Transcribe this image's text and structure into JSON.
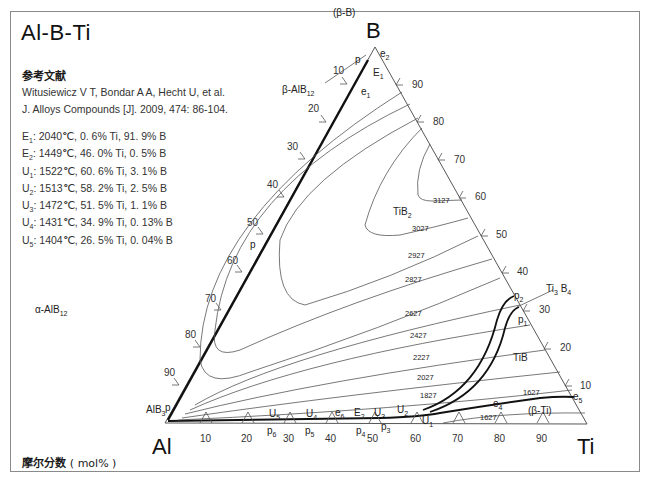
{
  "title": "Al-B-Ti",
  "reference": {
    "heading": "参考文献",
    "line1": "Witusiewicz V T, Bondar A A, Hecht U, et al.",
    "line2": "J. Alloys Compounds [J]. 2009, 474: 86-104."
  },
  "invariant_points": [
    {
      "sym": "E",
      "sub": "1",
      "text": ": 2040℃, 0. 6% Ti, 91. 9% B"
    },
    {
      "sym": "E",
      "sub": "2",
      "text": ": 1449℃, 46. 0% Ti, 0. 5% B"
    },
    {
      "sym": "U",
      "sub": "1",
      "text": ": 1522℃, 60. 6% Ti, 3. 1% B"
    },
    {
      "sym": "U",
      "sub": "2",
      "text": ": 1513℃, 58. 2% Ti, 2. 5% B"
    },
    {
      "sym": "U",
      "sub": "3",
      "text": ": 1472℃, 51. 5% Ti, 1. 1% B"
    },
    {
      "sym": "U",
      "sub": "4",
      "text": ": 1431℃, 34. 9% Ti, 0. 13% B"
    },
    {
      "sym": "U",
      "sub": "5",
      "text": ": 1404℃, 26. 5% Ti, 0. 04% B"
    }
  ],
  "unit_label": {
    "bold": "摩尔分数",
    "plain": "( mol% )"
  },
  "vertices": {
    "top": "B",
    "left": "Al",
    "right": "Ti"
  },
  "ticks": {
    "bottom": [
      "10",
      "20",
      "30",
      "40",
      "50",
      "60",
      "70",
      "80",
      "90"
    ],
    "left": [
      "10",
      "20",
      "30",
      "40",
      "50",
      "60",
      "70",
      "80",
      "90"
    ],
    "right": [
      "90",
      "80",
      "70",
      "60",
      "50",
      "40",
      "30",
      "20",
      "10"
    ]
  },
  "phase_labels": {
    "beta_b": "(β-B)",
    "beta_albl": "β-AlB",
    "beta_albl_sub": "12",
    "alpha_albl": "α-AlB",
    "alpha_albl_sub": "12",
    "alb3": "AlB",
    "alb3_sub": "3",
    "tib2": "TiB",
    "tib2_sub": "2",
    "ti3b4": "Ti",
    "ti3b4_sub1": "3",
    "ti3b4_mid": " B",
    "ti3b4_sub2": "4",
    "tib": "TiB",
    "beta_ti": "(β-Ti)"
  },
  "point_labels": {
    "p_top": "p",
    "e2": "e",
    "e2_sub": "2",
    "E1": "E",
    "E1_sub": "1",
    "e1": "e",
    "e1_sub": "1",
    "p_mid": "p",
    "p_low": "p",
    "p2": "p",
    "p2_sub": "2",
    "p1": "p",
    "p1_sub": "1",
    "e4": "e",
    "e4_sub": "4",
    "e5": "e",
    "e5_sub": "5",
    "U5": "U",
    "U5_sub": "5",
    "U4": "U",
    "U4_sub": "4",
    "e6": "e",
    "e6_sub": "6",
    "E2": "E",
    "E2_sub": "2",
    "U3": "U",
    "U3_sub": "3",
    "U2": "U",
    "U2_sub": "2",
    "U1": "U",
    "U1_sub": "1",
    "p6": "p",
    "p6_sub": "6",
    "p5": "p",
    "p5_sub": "5",
    "p4": "p",
    "p4_sub": "4",
    "p3": "p",
    "p3_sub": "3"
  },
  "isotherms": [
    "3127",
    "3027",
    "2927",
    "2827",
    "2627",
    "2427",
    "2227",
    "2027",
    "1827",
    "1627",
    "1627"
  ],
  "colors": {
    "line": "#333333",
    "thick": "#111111",
    "frame": "#8a8a8a"
  }
}
